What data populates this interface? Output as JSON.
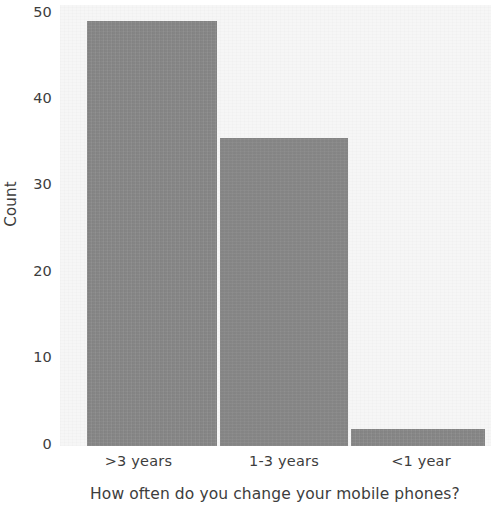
{
  "chart_data": {
    "type": "bar",
    "title": "",
    "subtitle": "",
    "xlabel": "How often do you change your mobile phones?",
    "ylabel": "Count",
    "categories": [
      ">3 years",
      "1-3 years",
      "<1 year"
    ],
    "values": [
      49,
      35.5,
      2
    ],
    "series": [
      {
        "name": "Count",
        "values": [
          49,
          35.5,
          2
        ]
      }
    ],
    "ylim": [
      0,
      50
    ],
    "yticks": [
      "0",
      "10",
      "20",
      "30",
      "40",
      "50"
    ],
    "ytick_values": [
      0,
      10,
      20,
      30,
      40,
      50
    ],
    "grid": false,
    "legend": false,
    "legend_position": "none",
    "bar_color": "#8a8a8a",
    "plot_background": "#f6f6f6",
    "figure_background": "#ffffff",
    "text_color": "#3d3d3d"
  },
  "axes": {
    "y": {
      "label": "Count",
      "ticks": [
        {
          "label": "50",
          "value": 50
        },
        {
          "label": "40",
          "value": 40
        },
        {
          "label": "30",
          "value": 30
        },
        {
          "label": "20",
          "value": 20
        },
        {
          "label": "10",
          "value": 10
        },
        {
          "label": "0",
          "value": 0
        }
      ]
    },
    "x": {
      "label": "How often do you change your mobile phones?",
      "ticks": [
        {
          "label": ">3 years"
        },
        {
          "label": "1-3 years"
        },
        {
          "label": "<1 year"
        }
      ]
    }
  }
}
